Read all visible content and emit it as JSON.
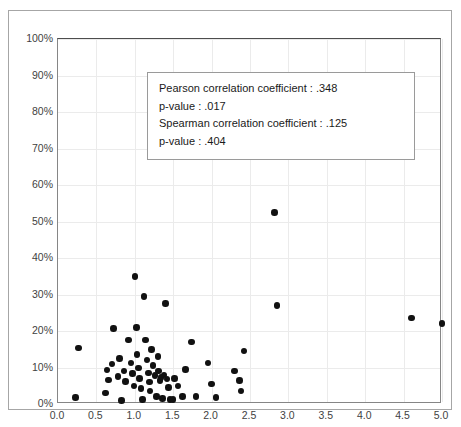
{
  "chart_data": {
    "type": "scatter",
    "title": "",
    "xlabel": "",
    "ylabel": "",
    "xlim": [
      0.0,
      5.0
    ],
    "ylim": [
      0,
      100
    ],
    "grid": true,
    "legend": null,
    "x_tick_labels": [
      "0.0",
      "0.5",
      "1.0",
      "1.5",
      "2.0",
      "2.5",
      "3.0",
      "3.5",
      "4.0",
      "4.5",
      "5.0"
    ],
    "x_tick_values": [
      0.0,
      0.5,
      1.0,
      1.5,
      2.0,
      2.5,
      3.0,
      3.5,
      4.0,
      4.5,
      5.0
    ],
    "y_tick_labels": [
      "0%",
      "10%",
      "20%",
      "30%",
      "40%",
      "50%",
      "60%",
      "70%",
      "80%",
      "90%",
      "100%"
    ],
    "y_tick_values": [
      0,
      10,
      20,
      30,
      40,
      50,
      60,
      70,
      80,
      90,
      100
    ],
    "marker_color": "#111111",
    "grid_color": "#ebebeb",
    "points": [
      {
        "x": 0.23,
        "y": 1.8
      },
      {
        "x": 0.27,
        "y": 15.3
      },
      {
        "x": 0.62,
        "y": 3.0
      },
      {
        "x": 0.64,
        "y": 9.3
      },
      {
        "x": 0.66,
        "y": 6.6
      },
      {
        "x": 0.7,
        "y": 11.0
      },
      {
        "x": 0.72,
        "y": 20.7
      },
      {
        "x": 0.78,
        "y": 7.5
      },
      {
        "x": 0.8,
        "y": 12.5
      },
      {
        "x": 0.83,
        "y": 1.0
      },
      {
        "x": 0.86,
        "y": 9.0
      },
      {
        "x": 0.88,
        "y": 6.2
      },
      {
        "x": 0.92,
        "y": 17.5
      },
      {
        "x": 0.95,
        "y": 11.3
      },
      {
        "x": 0.97,
        "y": 8.3
      },
      {
        "x": 0.99,
        "y": 5.0
      },
      {
        "x": 1.0,
        "y": 35.0
      },
      {
        "x": 1.02,
        "y": 21.0
      },
      {
        "x": 1.03,
        "y": 13.5
      },
      {
        "x": 1.05,
        "y": 9.8
      },
      {
        "x": 1.06,
        "y": 7.0
      },
      {
        "x": 1.08,
        "y": 4.2
      },
      {
        "x": 1.1,
        "y": 1.2
      },
      {
        "x": 1.12,
        "y": 29.5
      },
      {
        "x": 1.14,
        "y": 17.5
      },
      {
        "x": 1.16,
        "y": 12.0
      },
      {
        "x": 1.18,
        "y": 8.5
      },
      {
        "x": 1.19,
        "y": 6.0
      },
      {
        "x": 1.2,
        "y": 3.5
      },
      {
        "x": 1.22,
        "y": 15.0
      },
      {
        "x": 1.24,
        "y": 10.5
      },
      {
        "x": 1.26,
        "y": 7.8
      },
      {
        "x": 1.28,
        "y": 2.0
      },
      {
        "x": 1.3,
        "y": 13.0
      },
      {
        "x": 1.31,
        "y": 9.0
      },
      {
        "x": 1.33,
        "y": 6.5
      },
      {
        "x": 1.34,
        "y": 7.3
      },
      {
        "x": 1.36,
        "y": 1.5
      },
      {
        "x": 1.38,
        "y": 8.0
      },
      {
        "x": 1.4,
        "y": 27.5
      },
      {
        "x": 1.42,
        "y": 6.8
      },
      {
        "x": 1.44,
        "y": 4.5
      },
      {
        "x": 1.46,
        "y": 1.3
      },
      {
        "x": 1.5,
        "y": 1.3
      },
      {
        "x": 1.52,
        "y": 7.0
      },
      {
        "x": 1.56,
        "y": 5.0
      },
      {
        "x": 1.62,
        "y": 2.0
      },
      {
        "x": 1.66,
        "y": 9.5
      },
      {
        "x": 1.74,
        "y": 17.0
      },
      {
        "x": 1.8,
        "y": 2.0
      },
      {
        "x": 1.95,
        "y": 11.3
      },
      {
        "x": 2.0,
        "y": 5.5
      },
      {
        "x": 2.06,
        "y": 1.8
      },
      {
        "x": 2.3,
        "y": 9.0
      },
      {
        "x": 2.36,
        "y": 6.5
      },
      {
        "x": 2.38,
        "y": 3.5
      },
      {
        "x": 2.42,
        "y": 14.5
      },
      {
        "x": 2.82,
        "y": 52.5
      },
      {
        "x": 2.85,
        "y": 27.0
      },
      {
        "x": 4.6,
        "y": 23.5
      },
      {
        "x": 5.0,
        "y": 22.0
      }
    ]
  },
  "annotation": {
    "lines": [
      "Pearson correlation coefficient : .348",
      "p-value : .017",
      "Spearman correlation coefficient : .125",
      "p-value : .404"
    ],
    "pearson_label": "Pearson correlation coefficient : .348",
    "pearson_pvalue_label": "p-value : .017",
    "spearman_label": "Spearman correlation coefficient : .125",
    "spearman_pvalue_label": "p-value : .404"
  }
}
